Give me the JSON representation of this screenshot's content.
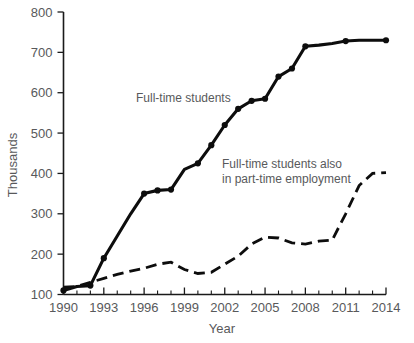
{
  "chart_data": {
    "type": "line",
    "title": "",
    "xlabel": "Year",
    "ylabel": "Thousands",
    "xlim": [
      1990,
      2014
    ],
    "ylim": [
      100,
      800
    ],
    "grid": false,
    "legend_position": "inline-annotation",
    "y_ticks": [
      100,
      200,
      300,
      400,
      500,
      600,
      700,
      800
    ],
    "y_tick_labels": [
      "100",
      "200",
      "300",
      "400",
      "500",
      "600",
      "700",
      "800"
    ],
    "x_ticks": [
      1990,
      1993,
      1996,
      1999,
      2002,
      2005,
      2008,
      2011,
      2014
    ],
    "x_tick_labels": [
      "1990",
      "1993",
      "1996",
      "1999",
      "2002",
      "2005",
      "2008",
      "2011",
      "2014"
    ],
    "x_minor_ticks": [
      1991,
      1992,
      1994,
      1995,
      1997,
      1998,
      2000,
      2001,
      2003,
      2004,
      2006,
      2007,
      2009,
      2010,
      2012,
      2013
    ],
    "x": [
      1990,
      1991,
      1992,
      1993,
      1994,
      1995,
      1996,
      1997,
      1998,
      1999,
      2000,
      2001,
      2002,
      2003,
      2004,
      2005,
      2006,
      2007,
      2008,
      2009,
      2010,
      2011,
      2012,
      2013,
      2014
    ],
    "series": [
      {
        "name": "Full-time students",
        "style": "solid",
        "markers": true,
        "color": "#0d0d0d",
        "label": "Full-time students",
        "values": [
          110,
          120,
          122,
          190,
          245,
          300,
          350,
          358,
          360,
          410,
          425,
          470,
          520,
          560,
          580,
          585,
          640,
          660,
          715,
          718,
          722,
          728,
          730,
          730,
          730
        ]
      },
      {
        "name": "Full-time students also in part-time employment",
        "style": "dashed",
        "markers": false,
        "color": "#0d0d0d",
        "label_line1": "Full-time students also",
        "label_line2": "in part-time employment",
        "values": [
          118,
          120,
          130,
          140,
          150,
          158,
          165,
          175,
          180,
          162,
          152,
          155,
          175,
          195,
          225,
          242,
          240,
          228,
          225,
          232,
          235,
          300,
          370,
          400,
          402
        ]
      }
    ],
    "annotations": [
      {
        "text": "Full-time students",
        "x_px": 136,
        "y_px": 102
      },
      {
        "text": "Full-time students also",
        "x_px": 222,
        "y_px": 168
      },
      {
        "text": "in part-time employment",
        "x_px": 222,
        "y_px": 183
      }
    ]
  }
}
